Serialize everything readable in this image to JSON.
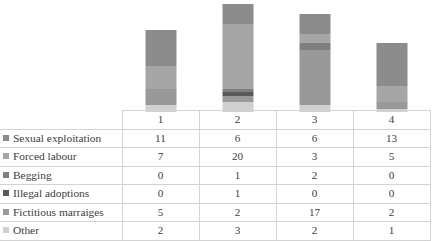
{
  "chart_data": {
    "type": "bar",
    "subtype": "stacked-column-with-data-table",
    "title": "",
    "xlabel": "",
    "ylabel": "",
    "grid": false,
    "legend_position": "data-table-row-headers",
    "categories": [
      "1",
      "2",
      "3",
      "4"
    ],
    "series": [
      {
        "name": "Sexual exploitation",
        "values": [
          11,
          6,
          6,
          13
        ],
        "color": "#8c8c8c"
      },
      {
        "name": "Forced labour",
        "values": [
          7,
          20,
          3,
          5
        ],
        "color": "#a6a6a6"
      },
      {
        "name": "Begging",
        "values": [
          0,
          1,
          2,
          0
        ],
        "color": "#7f7f7f"
      },
      {
        "name": "Illegal adoptions",
        "values": [
          0,
          1,
          0,
          0
        ],
        "color": "#595959"
      },
      {
        "name": "Fictitious marraiges",
        "values": [
          5,
          2,
          17,
          2
        ],
        "color": "#999999"
      },
      {
        "name": "Other",
        "values": [
          2,
          3,
          2,
          1
        ],
        "color": "#d0d0d0"
      }
    ],
    "column_totals": [
      25,
      33,
      30,
      21
    ],
    "ylim": [
      0,
      33
    ]
  },
  "table": {
    "header": {
      "corner_label": "",
      "columns": [
        "1",
        "2",
        "3",
        "4"
      ]
    },
    "rows": [
      {
        "label": "Sexual exploitation",
        "swatch": "#8c8c8c",
        "values": [
          "11",
          "6",
          "6",
          "13"
        ]
      },
      {
        "label": "Forced labour",
        "swatch": "#a6a6a6",
        "values": [
          "7",
          "20",
          "3",
          "5"
        ]
      },
      {
        "label": "Begging",
        "swatch": "#7f7f7f",
        "values": [
          "0",
          "1",
          "2",
          "0"
        ]
      },
      {
        "label": "Illegal adoptions",
        "swatch": "#595959",
        "values": [
          "0",
          "1",
          "0",
          "0"
        ]
      },
      {
        "label": "Fictitious marraiges",
        "swatch": "#999999",
        "values": [
          "5",
          "2",
          "17",
          "2"
        ]
      },
      {
        "label": "Other",
        "swatch": "#d0d0d0",
        "values": [
          "2",
          "3",
          "2",
          "1"
        ]
      }
    ]
  }
}
